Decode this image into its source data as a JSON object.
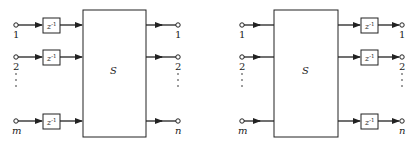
{
  "diagrams": [
    {
      "name": "left",
      "system_label": "S",
      "delay_label": "z",
      "delay_exponent": "-1",
      "delay_position": "inputs",
      "inputs": [
        "1",
        "2",
        "m"
      ],
      "outputs": [
        "1",
        "2",
        "n"
      ]
    },
    {
      "name": "right",
      "system_label": "S",
      "delay_label": "z",
      "delay_exponent": "-1",
      "delay_position": "outputs",
      "inputs": [
        "1",
        "2",
        "m"
      ],
      "outputs": [
        "1",
        "2",
        "n"
      ]
    }
  ],
  "colors": {
    "stroke": "#222222",
    "background": "#ffffff"
  }
}
